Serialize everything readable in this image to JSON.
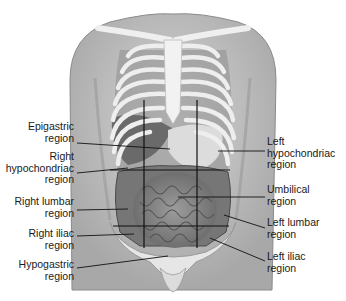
{
  "diagram": {
    "labels_left": [
      {
        "id": "epigastric",
        "line1": "Epigastric",
        "line2": "region"
      },
      {
        "id": "right-hypochondriac",
        "line1": "Right",
        "line2": "hypochondriac",
        "line3": "region"
      },
      {
        "id": "right-lumbar",
        "line1": "Right lumbar",
        "line2": "region"
      },
      {
        "id": "right-iliac",
        "line1": "Right iliac",
        "line2": "region"
      },
      {
        "id": "hypogastric",
        "line1": "Hypogastric",
        "line2": "region"
      }
    ],
    "labels_right": [
      {
        "id": "left-hypochondriac",
        "line1": "Left",
        "line2": "hypochondriac",
        "line3": "region"
      },
      {
        "id": "umbilical",
        "line1": "Umbilical",
        "line2": "region"
      },
      {
        "id": "left-lumbar",
        "line1": "Left lumbar",
        "line2": "region"
      },
      {
        "id": "left-iliac",
        "line1": "Left iliac",
        "line2": "region"
      }
    ],
    "colors": {
      "skin": "#c8c8c8",
      "skin_dark": "#9a9a9a",
      "bone": "#ececec",
      "organ": "#6e6e6e",
      "intestine": "#8a8a8a",
      "line": "#111111",
      "text": "#1a1a1a"
    }
  }
}
